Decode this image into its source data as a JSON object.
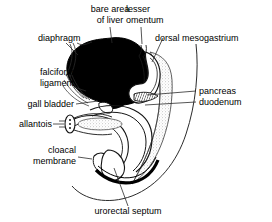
{
  "figure": {
    "background_color": "#ffffff",
    "ink_color": "#000000",
    "stipple_color": "#b9b9b9"
  },
  "labels": {
    "bare_area_line1": "bare area",
    "bare_area_line2": "of liver",
    "lesser_line1": "lesser",
    "lesser_line2": "omentum",
    "dorsal_mesogastrium": "dorsal mesogastrium",
    "diaphragm": "diaphragm",
    "falciform_line1": "falciform",
    "falciform_line2": "ligament",
    "gall_bladder": "gall bladder",
    "allantois": "allantois",
    "cloacal_line1": "cloacal",
    "cloacal_line2": "membrane",
    "pancreas": "pancreas",
    "duodenum": "duodenum",
    "urorectal_septum": "urorectal septum"
  },
  "structures": [
    {
      "name": "liver",
      "rendering": "solid-black-mass"
    },
    {
      "name": "bare-area-of-liver",
      "rendering": "solid-black-mass"
    },
    {
      "name": "diaphragm",
      "rendering": "thin-line-pair"
    },
    {
      "name": "falciform-ligament",
      "rendering": "thin-line-pair"
    },
    {
      "name": "lesser-omentum",
      "rendering": "thin-line-pair"
    },
    {
      "name": "dorsal-mesogastrium",
      "rendering": "stippled-band"
    },
    {
      "name": "stomach",
      "rendering": "outline-loop"
    },
    {
      "name": "duodenum",
      "rendering": "outline-loop"
    },
    {
      "name": "pancreas",
      "rendering": "hatched-patch"
    },
    {
      "name": "gall-bladder",
      "rendering": "small-outline-sac"
    },
    {
      "name": "allantois",
      "rendering": "stalk-with-lumen"
    },
    {
      "name": "cloacal-membrane",
      "rendering": "short-outline"
    },
    {
      "name": "urorectal-septum",
      "rendering": "wedge-outline"
    },
    {
      "name": "hindgut",
      "rendering": "thick-black-band"
    },
    {
      "name": "body-wall",
      "rendering": "thin-contour"
    }
  ]
}
